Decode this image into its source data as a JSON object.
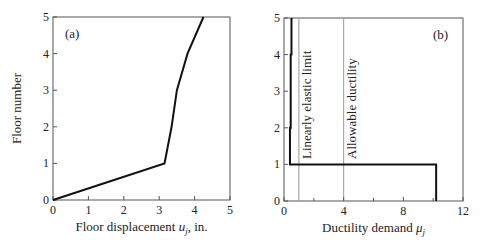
{
  "chart_data": [
    {
      "type": "line",
      "panel_label": "(a)",
      "xlabel": "Floor displacement u_j, in.",
      "xlabel_main": "Floor displacement ",
      "xlabel_var": "u",
      "xlabel_sub": "j",
      "xlabel_tail": ", in.",
      "ylabel": "Floor number",
      "xlim": [
        0,
        5
      ],
      "ylim": [
        0,
        5
      ],
      "xticks": [
        "0",
        "1",
        "2",
        "3",
        "4",
        "5"
      ],
      "yticks": [
        "0",
        "1",
        "2",
        "3",
        "4",
        "5"
      ],
      "series": [
        {
          "name": "Floor displacement",
          "x": [
            0,
            3.15,
            3.35,
            3.5,
            3.8,
            4.25
          ],
          "y": [
            0,
            1,
            2,
            3,
            4,
            5
          ]
        }
      ]
    },
    {
      "type": "line",
      "panel_label": "(b)",
      "xlabel": "Ductility demand μ_j",
      "xlabel_main": "Ductility demand ",
      "xlabel_var": "μ",
      "xlabel_sub": "j",
      "ylabel": "",
      "xlim": [
        0,
        12
      ],
      "ylim": [
        0,
        5
      ],
      "xticks": [
        "0",
        "4",
        "8",
        "12"
      ],
      "yticks": [
        "0",
        "1",
        "2",
        "3",
        "4",
        "5"
      ],
      "series": [
        {
          "name": "Ductility demand",
          "x": [
            10.2,
            10.2,
            0.4,
            0.4,
            0.45,
            0.45,
            0.5,
            0.5
          ],
          "y": [
            0,
            1,
            1,
            2,
            2,
            4,
            4,
            5
          ]
        }
      ],
      "reference_lines": [
        {
          "label": "Linearly elastic limit",
          "x": 1
        },
        {
          "label": "Allowable ductility",
          "x": 4
        }
      ]
    }
  ]
}
